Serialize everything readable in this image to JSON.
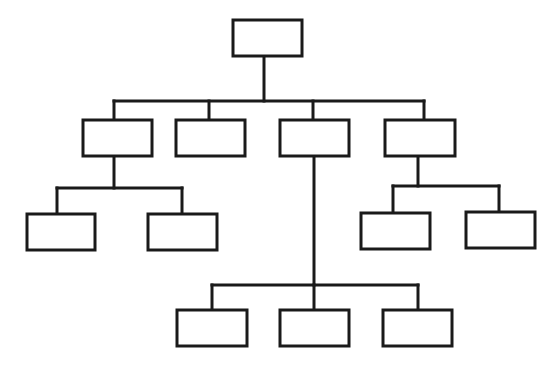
{
  "diagram": {
    "type": "org-chart",
    "stroke_color": "#1a1a1a",
    "fill_color": "#ffffff",
    "stroke_width": 3,
    "nodes": [
      {
        "id": "root",
        "label": "",
        "x": 233,
        "y": 20,
        "w": 69,
        "h": 36
      },
      {
        "id": "l1-a",
        "label": "",
        "x": 83,
        "y": 120,
        "w": 69,
        "h": 36
      },
      {
        "id": "l1-b",
        "label": "",
        "x": 176,
        "y": 120,
        "w": 69,
        "h": 36
      },
      {
        "id": "l1-c",
        "label": "",
        "x": 280,
        "y": 120,
        "w": 69,
        "h": 36
      },
      {
        "id": "l1-d",
        "label": "",
        "x": 385,
        "y": 120,
        "w": 70,
        "h": 36
      },
      {
        "id": "l2-a1",
        "label": "",
        "x": 27,
        "y": 214,
        "w": 68,
        "h": 36
      },
      {
        "id": "l2-a2",
        "label": "",
        "x": 148,
        "y": 214,
        "w": 69,
        "h": 36
      },
      {
        "id": "l2-d1",
        "label": "",
        "x": 361,
        "y": 213,
        "w": 69,
        "h": 36
      },
      {
        "id": "l2-d2",
        "label": "",
        "x": 466,
        "y": 212,
        "w": 69,
        "h": 36
      },
      {
        "id": "l3-c1",
        "label": "",
        "x": 177,
        "y": 310,
        "w": 70,
        "h": 36
      },
      {
        "id": "l3-c2",
        "label": "",
        "x": 280,
        "y": 310,
        "w": 69,
        "h": 36
      },
      {
        "id": "l3-c3",
        "label": "",
        "x": 383,
        "y": 310,
        "w": 69,
        "h": 36
      }
    ],
    "edges": [
      {
        "from": "root",
        "to": "l1-a"
      },
      {
        "from": "root",
        "to": "l1-b"
      },
      {
        "from": "root",
        "to": "l1-c"
      },
      {
        "from": "root",
        "to": "l1-d"
      },
      {
        "from": "l1-a",
        "to": "l2-a1"
      },
      {
        "from": "l1-a",
        "to": "l2-a2"
      },
      {
        "from": "l1-d",
        "to": "l2-d1"
      },
      {
        "from": "l1-d",
        "to": "l2-d2"
      },
      {
        "from": "l1-c",
        "to": "l3-c1"
      },
      {
        "from": "l1-c",
        "to": "l3-c2"
      },
      {
        "from": "l1-c",
        "to": "l3-c3"
      }
    ]
  }
}
